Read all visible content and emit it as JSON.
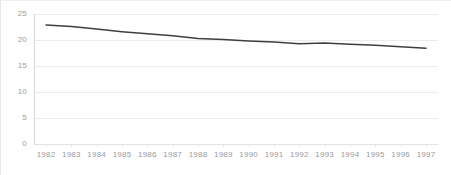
{
  "chart_data": {
    "type": "line",
    "title": "",
    "subtitle": "",
    "xlabel": "",
    "ylabel": "",
    "grid": true,
    "legend": false,
    "legend_position": "none",
    "line_color": "#3f3f3f",
    "grid_color": "#ececed",
    "tick_label_color": "#9a9a9c",
    "x": [
      1982,
      1983,
      1984,
      1985,
      1986,
      1987,
      1988,
      1989,
      1990,
      1991,
      1992,
      1993,
      1994,
      1995,
      1996,
      1997
    ],
    "categories": [
      "1982",
      "1983",
      "1984",
      "1985",
      "1986",
      "1987",
      "1988",
      "1989",
      "1990",
      "1991",
      "1992",
      "1993",
      "1994",
      "1995",
      "1996",
      "1997"
    ],
    "values": [
      22.9,
      22.6,
      22.1,
      21.6,
      21.2,
      20.8,
      20.3,
      20.1,
      19.8,
      19.6,
      19.3,
      19.4,
      19.2,
      19.0,
      18.7,
      18.4
    ],
    "series": [
      {
        "name": "series-1",
        "values": [
          22.9,
          22.6,
          22.1,
          21.6,
          21.2,
          20.8,
          20.3,
          20.1,
          19.8,
          19.6,
          19.3,
          19.4,
          19.2,
          19.0,
          18.7,
          18.4
        ]
      }
    ],
    "ylim": [
      0,
      25
    ],
    "yticks": [
      0,
      5,
      10,
      15,
      20,
      25
    ],
    "ytick_labels": [
      "0",
      "5",
      "10",
      "15",
      "20",
      "25"
    ],
    "xlim": [
      1982,
      1997
    ],
    "xtick_labels": [
      "1982",
      "1983",
      "1984",
      "1985",
      "1986",
      "1987",
      "1988",
      "1989",
      "1990",
      "1991",
      "1992",
      "1993",
      "1994",
      "1995",
      "1996",
      "1997"
    ],
    "annotations": []
  }
}
